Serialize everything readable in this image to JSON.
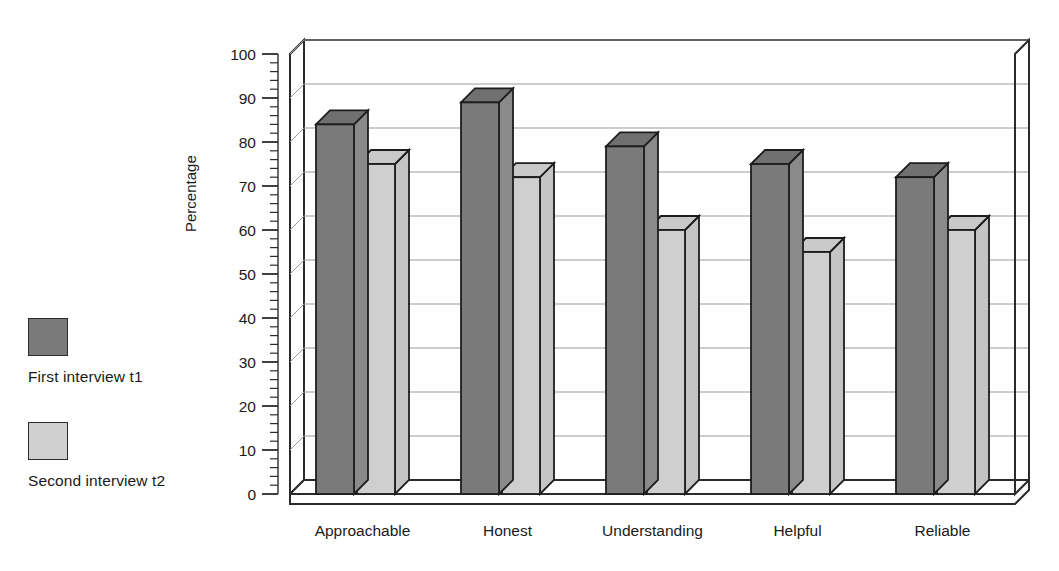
{
  "chart_data": {
    "type": "bar",
    "title": "",
    "xlabel": "",
    "ylabel": "Percentage",
    "ylim": [
      0,
      100
    ],
    "ytick_step": 10,
    "minor_tick_step": 2,
    "grid": true,
    "style": "3d-clustered-column",
    "legend_position": "left",
    "categories": [
      "Approachable",
      "Honest",
      "Understanding",
      "Helpful",
      "Reliable"
    ],
    "series": [
      {
        "name": "First interview t1",
        "color": "#7a7a7a",
        "values": [
          84,
          89,
          79,
          75,
          72
        ]
      },
      {
        "name": "Second interview t2",
        "color": "#cfcfcf",
        "values": [
          75,
          72,
          60,
          55,
          60
        ]
      }
    ],
    "yticks": [
      "0",
      "10",
      "20",
      "30",
      "40",
      "50",
      "60",
      "70",
      "80",
      "90",
      "100"
    ]
  },
  "legend": {
    "items": [
      {
        "label": "First interview t1",
        "swatch": "dark"
      },
      {
        "label": "Second interview t2",
        "swatch": "light"
      }
    ]
  },
  "axis": {
    "y_title": "Percentage"
  }
}
